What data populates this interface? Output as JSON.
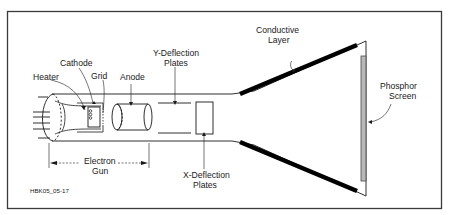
{
  "figure_id": "HBK05_05-17",
  "labels": {
    "heater": "Heater",
    "cathode": "Cathode",
    "grid": "Grid",
    "anode": "Anode",
    "y_deflection_1": "Y-Deflection",
    "y_deflection_2": "Plates",
    "x_deflection_1": "X-Deflection",
    "x_deflection_2": "Plates",
    "electron_gun_1": "Electron",
    "electron_gun_2": "Gun",
    "conductive_1": "Conductive",
    "conductive_2": "Layer",
    "phosphor_1": "Phosphor",
    "phosphor_2": "Screen"
  },
  "colors": {
    "frame": "#3a3a3a",
    "line": "#1a1a1a",
    "conductive_layer": "#000000",
    "phosphor_fill": "#b8b8b8"
  }
}
